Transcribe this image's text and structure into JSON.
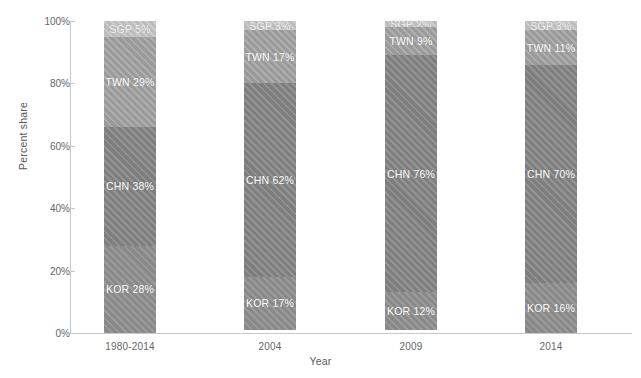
{
  "chart_data": {
    "type": "bar",
    "subtype": "stacked-percent",
    "title": "",
    "xlabel": "Year",
    "ylabel": "Percent share",
    "categories": [
      "1980-2014",
      "2004",
      "2009",
      "2014"
    ],
    "ylim": [
      0,
      100
    ],
    "yticks": [
      0,
      20,
      40,
      60,
      80,
      100
    ],
    "ytick_labels": [
      "0%",
      "20%",
      "40%",
      "60%",
      "80%",
      "100%"
    ],
    "grid": false,
    "legend": "none",
    "stack_order_bottom_to_top": [
      "KOR",
      "CHN",
      "TWN",
      "SGP"
    ],
    "series": [
      {
        "name": "KOR",
        "color": "#8f8f8f",
        "values": [
          28,
          17,
          12,
          16
        ]
      },
      {
        "name": "CHN",
        "color": "#868686",
        "values": [
          38,
          62,
          76,
          70
        ]
      },
      {
        "name": "TWN",
        "color": "#a2a2a2",
        "values": [
          29,
          17,
          9,
          11
        ]
      },
      {
        "name": "SGP",
        "color": "#c4c4c4",
        "values": [
          5,
          3,
          2,
          3
        ]
      }
    ],
    "bars": [
      {
        "category": "1980-2014",
        "segments": [
          {
            "name": "SGP",
            "value": 5,
            "label": "SGP 5%"
          },
          {
            "name": "TWN",
            "value": 29,
            "label": "TWN 29%"
          },
          {
            "name": "CHN",
            "value": 38,
            "label": "CHN 38%"
          },
          {
            "name": "KOR",
            "value": 28,
            "label": "KOR 28%"
          }
        ]
      },
      {
        "category": "2004",
        "segments": [
          {
            "name": "SGP",
            "value": 3,
            "label": "SGP 3%"
          },
          {
            "name": "TWN",
            "value": 17,
            "label": "TWN 17%"
          },
          {
            "name": "CHN",
            "value": 62,
            "label": "CHN 62%"
          },
          {
            "name": "KOR",
            "value": 17,
            "label": "KOR 17%"
          }
        ]
      },
      {
        "category": "2009",
        "segments": [
          {
            "name": "SGP",
            "value": 2,
            "label": "SGP 2%"
          },
          {
            "name": "TWN",
            "value": 9,
            "label": "TWN 9%"
          },
          {
            "name": "CHN",
            "value": 76,
            "label": "CHN 76%"
          },
          {
            "name": "KOR",
            "value": 12,
            "label": "KOR 12%"
          }
        ]
      },
      {
        "category": "2014",
        "segments": [
          {
            "name": "SGP",
            "value": 3,
            "label": "SGP 3%"
          },
          {
            "name": "TWN",
            "value": 11,
            "label": "TWN 11%"
          },
          {
            "name": "CHN",
            "value": 70,
            "label": "CHN 70%"
          },
          {
            "name": "KOR",
            "value": 16,
            "label": "KOR 16%"
          }
        ]
      }
    ],
    "colors": {
      "KOR": "#8f8f8f",
      "CHN": "#868686",
      "TWN": "#a2a2a2",
      "SGP": "#c4c4c4",
      "axis": "#c8c8c8",
      "tick_text": "#666666",
      "axis_title": "#5a5a5a",
      "segment_text": "#ffffff",
      "background": "#ffffff"
    }
  }
}
